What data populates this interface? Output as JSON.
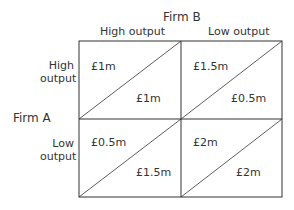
{
  "column_player": "Firm B",
  "row_player": "Firm A",
  "columns": [
    {
      "label": "High output"
    },
    {
      "label": "Low output"
    }
  ],
  "rows": [
    {
      "label_line1": "High",
      "label_line2": "output"
    },
    {
      "label_line1": "Low",
      "label_line2": "output"
    }
  ],
  "payoffs": [
    [
      {
        "firm_a": "£1m",
        "firm_b": "£1m"
      },
      {
        "firm_a": "£1.5m",
        "firm_b": "£0.5m"
      }
    ],
    [
      {
        "firm_a": "£0.5m",
        "firm_b": "£1.5m"
      },
      {
        "firm_a": "£2m",
        "firm_b": "£2m"
      }
    ]
  ],
  "colors": {
    "line": "#333333",
    "text": "#333333",
    "background": "#ffffff"
  }
}
